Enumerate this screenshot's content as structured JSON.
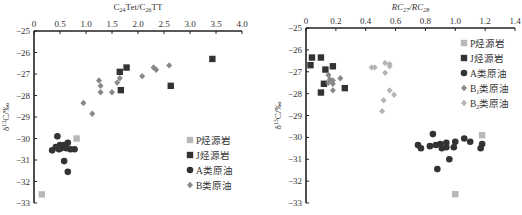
{
  "chart_data": [
    {
      "type": "scatter",
      "title": "",
      "xlabel": "C24Tet/C26TT",
      "xlabel_parts": {
        "a": "C",
        "a_sub": "24",
        "b": "Tet/C",
        "b_sub": "26",
        "c": "TT"
      },
      "ylabel": "δ13C/‰",
      "xlim": [
        0,
        4.0
      ],
      "ylim": [
        -33,
        -25
      ],
      "x_ticks": [
        "0",
        "0.5",
        "1.0",
        "1.5",
        "2.0",
        "2.5",
        "3.0",
        "3.5",
        "4.0"
      ],
      "y_ticks": [
        "-25",
        "-26",
        "-27",
        "-28",
        "-29",
        "-30",
        "-31",
        "-32",
        "-33"
      ],
      "x_axis_position": "top",
      "grid": false,
      "legend_position": "right-middle",
      "series": [
        {
          "name": "P烃源岩",
          "marker": "square",
          "color": "#b8b8b8",
          "points": [
            [
              0.15,
              -32.6
            ],
            [
              0.82,
              -30.0
            ]
          ]
        },
        {
          "name": "J烃源岩",
          "marker": "square",
          "color": "#333333",
          "points": [
            [
              1.65,
              -26.9
            ],
            [
              1.78,
              -26.7
            ],
            [
              1.67,
              -27.75
            ],
            [
              2.63,
              -27.55
            ],
            [
              3.43,
              -26.3
            ]
          ]
        },
        {
          "name": "A类原油",
          "marker": "circle",
          "color": "#333333",
          "points": [
            [
              0.35,
              -30.55
            ],
            [
              0.42,
              -30.4
            ],
            [
              0.45,
              -29.9
            ],
            [
              0.5,
              -30.3
            ],
            [
              0.52,
              -30.45
            ],
            [
              0.58,
              -30.3
            ],
            [
              0.62,
              -30.45
            ],
            [
              0.65,
              -30.2
            ],
            [
              0.7,
              -30.5
            ],
            [
              0.78,
              -30.5
            ],
            [
              0.58,
              -31.05
            ],
            [
              0.65,
              -31.55
            ],
            [
              0.55,
              -30.35
            ],
            [
              0.48,
              -30.5
            ]
          ]
        },
        {
          "name": "B类原油",
          "marker": "diamond",
          "color": "#888888",
          "points": [
            [
              0.95,
              -28.35
            ],
            [
              1.12,
              -28.85
            ],
            [
              1.25,
              -27.3
            ],
            [
              1.28,
              -27.55
            ],
            [
              1.28,
              -27.85
            ],
            [
              1.5,
              -27.85
            ],
            [
              1.6,
              -27.4
            ],
            [
              1.65,
              -27.2
            ],
            [
              2.08,
              -27.1
            ],
            [
              2.3,
              -26.7
            ],
            [
              2.35,
              -26.8
            ],
            [
              2.6,
              -26.6
            ]
          ]
        }
      ]
    },
    {
      "type": "scatter",
      "title": "",
      "xlabel": "RC27/RC28",
      "xlabel_parts": {
        "a": "RC",
        "a_sub": "27",
        "b": "/RC",
        "b_sub": "28"
      },
      "ylabel": "δ13C/‰",
      "xlim": [
        0,
        1.4
      ],
      "ylim": [
        -33,
        -25
      ],
      "x_ticks": [
        "0",
        "0.2",
        "0.4",
        "0.6",
        "0.8",
        "1.0",
        "1.2",
        "1.4"
      ],
      "y_ticks": [
        "-25",
        "-26",
        "-27",
        "-28",
        "-29",
        "-30",
        "-31",
        "-32",
        "-33"
      ],
      "x_axis_position": "top",
      "grid": false,
      "legend_position": "right-top",
      "series": [
        {
          "name": "P烃源岩",
          "marker": "square",
          "color": "#b8b8b8",
          "points": [
            [
              1.0,
              -32.6
            ],
            [
              1.18,
              -29.9
            ]
          ]
        },
        {
          "name": "J烃源岩",
          "marker": "square",
          "color": "#333333",
          "points": [
            [
              0.04,
              -26.35
            ],
            [
              0.1,
              -26.35
            ],
            [
              0.03,
              -26.7
            ],
            [
              0.18,
              -26.75
            ],
            [
              0.13,
              -26.9
            ],
            [
              0.12,
              -27.55
            ],
            [
              0.1,
              -27.95
            ],
            [
              0.26,
              -27.75
            ]
          ]
        },
        {
          "name": "A类原油",
          "marker": "circle",
          "color": "#333333",
          "points": [
            [
              0.75,
              -30.35
            ],
            [
              0.77,
              -30.5
            ],
            [
              0.83,
              -30.4
            ],
            [
              0.85,
              -29.85
            ],
            [
              0.87,
              -30.35
            ],
            [
              0.9,
              -30.3
            ],
            [
              0.91,
              -30.5
            ],
            [
              0.94,
              -30.25
            ],
            [
              0.94,
              -30.45
            ],
            [
              0.96,
              -31.0
            ],
            [
              0.88,
              -31.45
            ],
            [
              0.99,
              -30.45
            ],
            [
              1.0,
              -30.2
            ],
            [
              1.06,
              -30.05
            ],
            [
              1.1,
              -30.2
            ],
            [
              1.18,
              -30.3
            ],
            [
              1.17,
              -30.5
            ]
          ]
        },
        {
          "name": "B1类原油",
          "marker": "diamond",
          "color": "#888888",
          "points": [
            [
              0.15,
              -27.15
            ],
            [
              0.16,
              -27.35
            ],
            [
              0.18,
              -27.4
            ],
            [
              0.18,
              -27.55
            ],
            [
              0.23,
              -27.3
            ],
            [
              0.18,
              -27.85
            ],
            [
              0.15,
              -27.5
            ]
          ]
        },
        {
          "name": "B2类原油",
          "marker": "diamond",
          "color": "#b5b5b5",
          "points": [
            [
              0.44,
              -26.8
            ],
            [
              0.46,
              -26.8
            ],
            [
              0.53,
              -26.6
            ],
            [
              0.56,
              -26.65
            ],
            [
              0.56,
              -26.75
            ],
            [
              0.53,
              -27.05
            ],
            [
              0.56,
              -27.85
            ],
            [
              0.59,
              -28.05
            ],
            [
              0.52,
              -28.3
            ],
            [
              0.51,
              -28.8
            ]
          ]
        }
      ]
    }
  ],
  "legend_left": [
    "P烃源岩",
    "J烃源岩",
    "A类原油",
    "B类原油"
  ],
  "legend_right": [
    "P烃源岩",
    "J烃源岩",
    "A类原油",
    "B1类原油",
    "B2类原油"
  ]
}
